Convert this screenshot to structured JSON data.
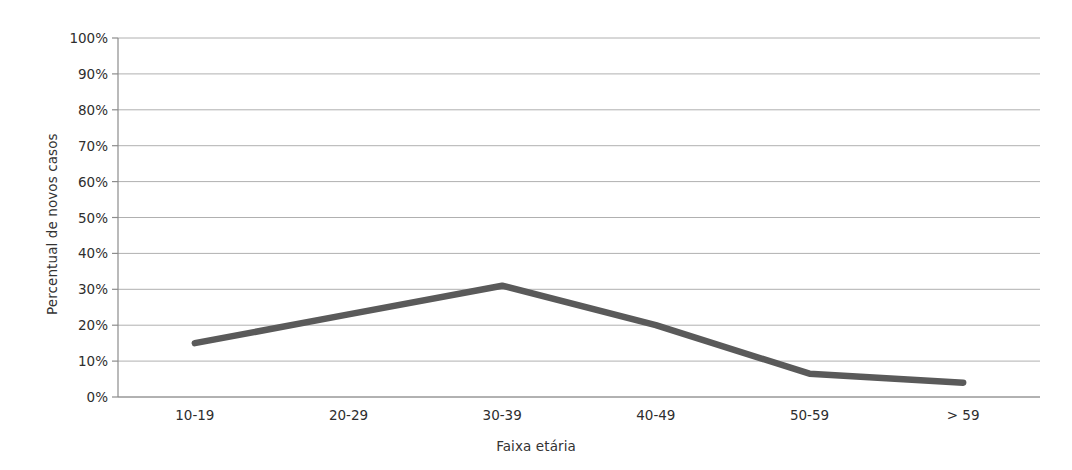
{
  "chart_data": {
    "type": "line",
    "title": "",
    "subtitle": "",
    "xlabel": "Faixa etária",
    "ylabel": "Percentual de novos casos",
    "categories": [
      "10-19",
      "20-29",
      "30-39",
      "40-49",
      "50-59",
      "> 59"
    ],
    "values": [
      15,
      23,
      31,
      20,
      6.5,
      4
    ],
    "ytick_labels": [
      "100%",
      "90%",
      "80%",
      "70%",
      "60%",
      "50%",
      "40%",
      "30%",
      "20%",
      "10%",
      "0%"
    ],
    "ytick_values": [
      100,
      90,
      80,
      70,
      60,
      50,
      40,
      30,
      20,
      10,
      0
    ],
    "ylim": [
      0,
      100
    ],
    "grid": "horizontal",
    "legend": "none",
    "series": [
      {
        "name": "Percentual de novos casos",
        "color": "#5a5a5a",
        "values": [
          15,
          23,
          31,
          20,
          6.5,
          4
        ]
      }
    ],
    "colors": {
      "line": "#5a5a5a",
      "gridline": "#b0b0b0",
      "axis": "#8c8c8c",
      "text": "#2e2e2e",
      "background": "#ffffff"
    }
  }
}
